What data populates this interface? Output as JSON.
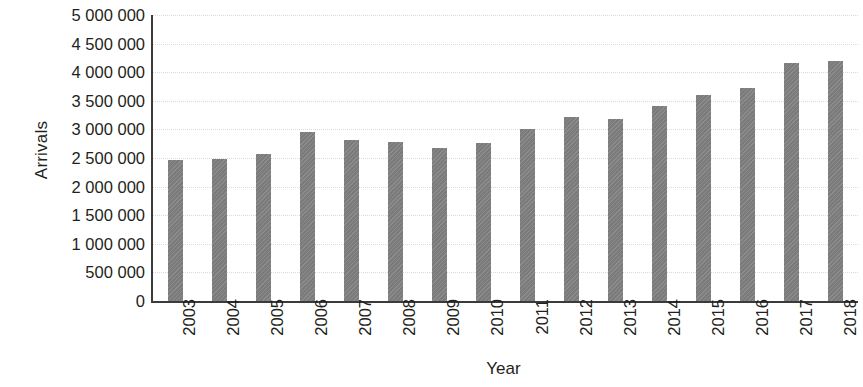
{
  "chart_data": {
    "type": "bar",
    "title": "",
    "xlabel": "Year",
    "ylabel": "Arrivals",
    "categories": [
      "2003",
      "2004",
      "2005",
      "2006",
      "2007",
      "2008",
      "2009",
      "2010",
      "2011",
      "2012",
      "2013",
      "2014",
      "2015",
      "2016",
      "2017",
      "2018"
    ],
    "values": [
      2470000,
      2490000,
      2570000,
      2960000,
      2820000,
      2780000,
      2680000,
      2760000,
      3010000,
      3220000,
      3180000,
      3410000,
      3600000,
      3720000,
      4160000,
      4200000
    ],
    "ylim": [
      0,
      5000000
    ],
    "ytick_values": [
      0,
      500000,
      1000000,
      1500000,
      2000000,
      2500000,
      3000000,
      3500000,
      4000000,
      4500000,
      5000000
    ],
    "ytick_labels": [
      "0",
      "500 000",
      "1 000 000",
      "1 500 000",
      "2 000 000",
      "2 500 000",
      "3 000 000",
      "3 500 000",
      "4 000 000",
      "4 500 000",
      "5 000 000"
    ],
    "grid": true,
    "grid_style": "dotted",
    "legend": false,
    "legend_position": "none",
    "bar_color": "#7f7f7f",
    "axis_color": "#3b3b3b",
    "gridline_color": "#d9d9e0",
    "text_color": "#231f20",
    "xtick_rotation": 90,
    "background_color": "#ffffff"
  }
}
